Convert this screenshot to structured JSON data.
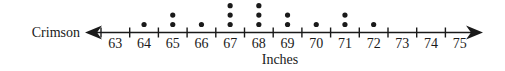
{
  "chart_data": {
    "type": "scatter",
    "subtype": "dot-plot",
    "title": "",
    "row_label": "Crimson",
    "xlabel": "Inches",
    "ylabel": "",
    "xlim": [
      63,
      75
    ],
    "tick_labels": [
      "63",
      "64",
      "65",
      "66",
      "67",
      "68",
      "69",
      "70",
      "71",
      "72",
      "73",
      "74",
      "75"
    ],
    "categories": [
      63,
      64,
      65,
      66,
      67,
      68,
      69,
      70,
      71,
      72,
      73,
      74,
      75
    ],
    "counts": [
      0,
      1,
      2,
      1,
      3,
      3,
      2,
      1,
      2,
      1,
      0,
      0,
      0
    ],
    "data": [
      64,
      65,
      65,
      66,
      67,
      67,
      67,
      68,
      68,
      68,
      69,
      69,
      70,
      71,
      71,
      72
    ],
    "grid": false,
    "legend": "none",
    "colors": {
      "ink": "#1a1a1a"
    }
  }
}
